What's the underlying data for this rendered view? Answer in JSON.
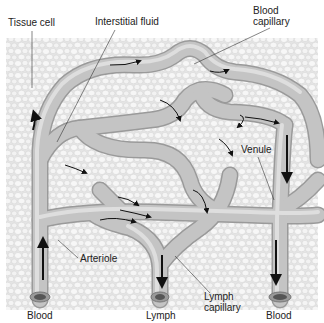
{
  "labels": {
    "tissue_cell": "Tissue cell",
    "interstitial_fluid": "Interstitial fluid",
    "blood_capillary_1": "Blood",
    "blood_capillary_2": "capillary",
    "venule": "Venule",
    "arteriole": "Arteriole",
    "lymph_capillary_1": "Lymph",
    "lymph_capillary_2": "capillary",
    "blood_left": "Blood",
    "lymph": "Lymph",
    "blood_right": "Blood"
  },
  "colors": {
    "background": "#ffffff",
    "tissue": "#e9e9e9",
    "cell": "#f6f6f6",
    "vessel": "#bcbcbc",
    "vessel_highlight": "#dcdcdc",
    "arrow": "#111111"
  }
}
